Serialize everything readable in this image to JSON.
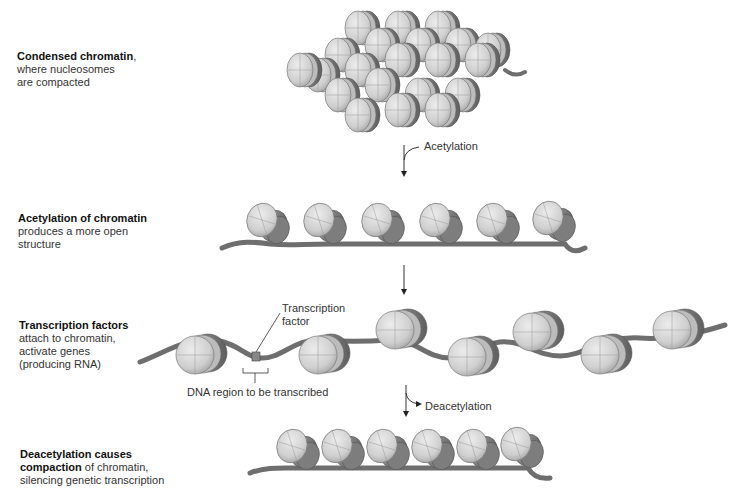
{
  "stages": [
    {
      "id": "condensed",
      "title": "Condensed chromatin",
      "title_suffix": ",",
      "lines": [
        "where nucleosomes",
        "are compacted"
      ]
    },
    {
      "id": "acetylated",
      "title": "Acetylation of chromatin",
      "lines": [
        "produces a more open",
        "structure"
      ]
    },
    {
      "id": "transcription",
      "title": "Transcription factors",
      "lines": [
        "attach to chromatin,",
        "activate genes",
        "(producing RNA)"
      ]
    },
    {
      "id": "deacetylated",
      "title_line1": "Deacetylation causes",
      "title_line2": "compaction",
      "line2_rest": " of chromatin,",
      "lines": [
        "silencing genetic transcription"
      ]
    }
  ],
  "arrows": {
    "acetylation": "Acetylation",
    "deacetylation": "Deacetylation"
  },
  "callouts": {
    "transcription_factor_line1": "Transcription",
    "transcription_factor_line2": "factor",
    "dna_region": "DNA region to be transcribed"
  },
  "colors": {
    "nucleosome_fill": "#d4d4d4",
    "nucleosome_edge": "#8a8a8a",
    "dna_strand": "#6e6e6e",
    "text": "#333333"
  }
}
